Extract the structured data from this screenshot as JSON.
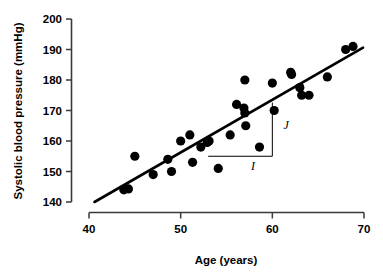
{
  "chart_data": {
    "type": "scatter",
    "title": "",
    "xlabel": "Age (years)",
    "ylabel": "Systolic blood pressure (mmHg)",
    "xlim": [
      40,
      70
    ],
    "ylim": [
      140,
      200
    ],
    "xticks": [
      40,
      50,
      60,
      70
    ],
    "yticks": [
      140,
      150,
      160,
      170,
      180,
      190,
      200
    ],
    "xtick_labels": [
      "40",
      "50",
      "60",
      "70"
    ],
    "ytick_labels": [
      "140",
      "150",
      "160",
      "170",
      "180",
      "190",
      "200"
    ],
    "grid": false,
    "legend": false,
    "marker": {
      "shape": "circle",
      "color": "#000000",
      "size": 4.6
    },
    "points": [
      {
        "x": 43.8,
        "y": 144.0
      },
      {
        "x": 44.3,
        "y": 144.3
      },
      {
        "x": 45.0,
        "y": 155.0
      },
      {
        "x": 47.0,
        "y": 149.0
      },
      {
        "x": 48.6,
        "y": 154.0
      },
      {
        "x": 49.0,
        "y": 150.0
      },
      {
        "x": 50.0,
        "y": 160.0
      },
      {
        "x": 51.0,
        "y": 162.0
      },
      {
        "x": 51.3,
        "y": 153.0
      },
      {
        "x": 52.2,
        "y": 158.0
      },
      {
        "x": 52.9,
        "y": 159.5
      },
      {
        "x": 53.1,
        "y": 160.0
      },
      {
        "x": 54.1,
        "y": 151.0
      },
      {
        "x": 55.4,
        "y": 162.0
      },
      {
        "x": 56.1,
        "y": 172.0
      },
      {
        "x": 56.9,
        "y": 170.8
      },
      {
        "x": 57.0,
        "y": 169.2
      },
      {
        "x": 57.0,
        "y": 180.0
      },
      {
        "x": 57.1,
        "y": 165.0
      },
      {
        "x": 58.6,
        "y": 158.0
      },
      {
        "x": 60.0,
        "y": 179.0
      },
      {
        "x": 60.2,
        "y": 170.0
      },
      {
        "x": 62.0,
        "y": 182.5
      },
      {
        "x": 62.1,
        "y": 181.8
      },
      {
        "x": 63.0,
        "y": 177.5
      },
      {
        "x": 63.2,
        "y": 175.0
      },
      {
        "x": 64.0,
        "y": 175.0
      },
      {
        "x": 66.0,
        "y": 181.0
      },
      {
        "x": 68.0,
        "y": 190.0
      },
      {
        "x": 68.8,
        "y": 191.0
      }
    ],
    "fit_line": {
      "label": "regression line",
      "x_start": 40.6,
      "y_start": 140.0,
      "x_end": 69.9,
      "y_end": 190.6
    },
    "annotations": [
      {
        "name": "run-segment",
        "label": "I",
        "type": "horizontal-segment",
        "x_start": 53.0,
        "x_end": 60.0,
        "y": 155.0,
        "label_x": 57.9,
        "label_y": 150.5
      },
      {
        "name": "rise-segment",
        "label": "J",
        "type": "vertical-segment",
        "x": 60.0,
        "y_start": 155.0,
        "y_end": 172.6,
        "label_x": 61.5,
        "label_y": 163.8
      }
    ]
  },
  "axes": {
    "x_axis_name": "age-axis",
    "y_axis_name": "systolic-bp-axis"
  }
}
